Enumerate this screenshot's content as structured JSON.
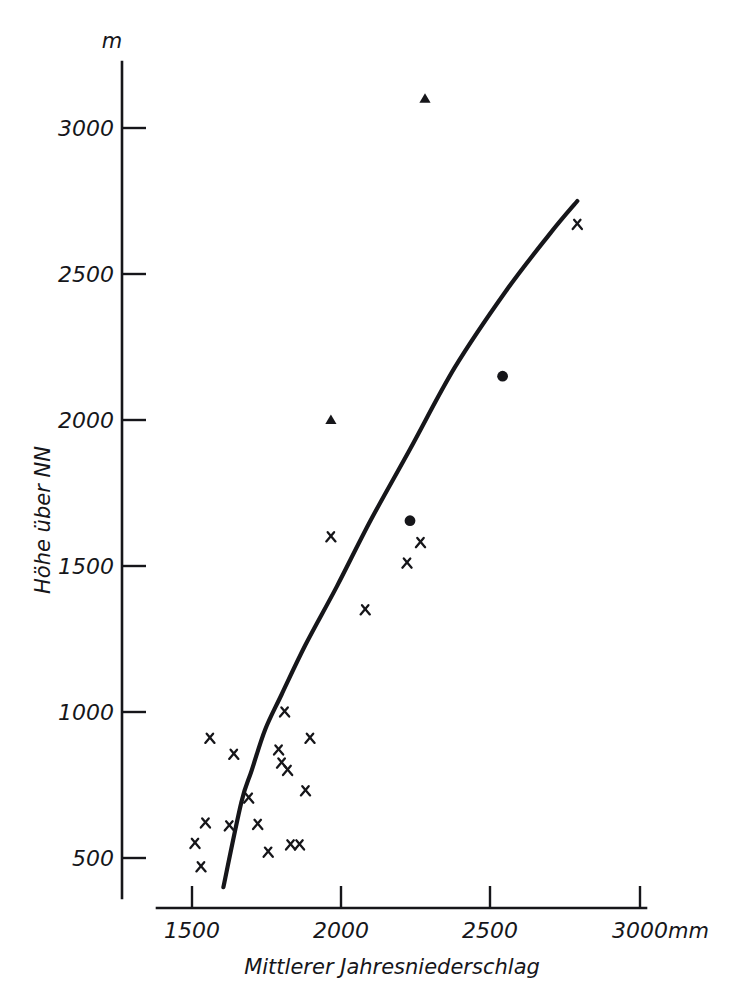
{
  "figure": {
    "cut_off_caption": "",
    "background_color": "#ffffff",
    "ink_color": "#16161a"
  },
  "axes": {
    "y": {
      "unit_label": "m",
      "title": "Höhe über NN",
      "ticks": [
        "500",
        "1000",
        "1500",
        "2000",
        "2500",
        "3000"
      ],
      "range": [
        380,
        3180
      ]
    },
    "x": {
      "unit_label": "mm",
      "title": "Mittlerer Jahresniederschlag",
      "ticks": [
        "1500",
        "2000",
        "2500",
        "3000"
      ],
      "range": [
        1380,
        3080
      ]
    }
  },
  "chart_data": {
    "type": "scatter",
    "title": "",
    "xlabel": "Mittlerer Jahresniederschlag",
    "ylabel": "Höhe über NN",
    "x_unit": "mm",
    "y_unit": "m",
    "xlim": [
      1380,
      3080
    ],
    "ylim": [
      380,
      3180
    ],
    "xticks": [
      1500,
      2000,
      2500,
      3000
    ],
    "yticks": [
      500,
      1000,
      1500,
      2000,
      2500,
      3000
    ],
    "grid": false,
    "legend": "none",
    "series": [
      {
        "name": "cross-markers",
        "marker": "x",
        "points": [
          [
            1560,
            910
          ],
          [
            1510,
            550
          ],
          [
            1545,
            620
          ],
          [
            1530,
            470
          ],
          [
            1625,
            610
          ],
          [
            1690,
            705
          ],
          [
            1720,
            615
          ],
          [
            1755,
            520
          ],
          [
            1790,
            870
          ],
          [
            1800,
            825
          ],
          [
            1820,
            800
          ],
          [
            1830,
            545
          ],
          [
            1860,
            545
          ],
          [
            1810,
            1000
          ],
          [
            1895,
            910
          ],
          [
            1880,
            730
          ],
          [
            1965,
            1600
          ],
          [
            2080,
            1350
          ],
          [
            2220,
            1510
          ],
          [
            2265,
            1580
          ],
          [
            2790,
            2670
          ],
          [
            1640,
            855
          ]
        ]
      },
      {
        "name": "filled-circle-markers",
        "marker": "o",
        "points": [
          [
            2230,
            1655
          ],
          [
            2540,
            2150
          ]
        ]
      },
      {
        "name": "triangle-markers",
        "marker": "^",
        "points": [
          [
            1965,
            2000
          ],
          [
            2280,
            3100
          ]
        ]
      }
    ],
    "fit_curve": {
      "name": "regression-curve",
      "points": [
        [
          1605,
          400
        ],
        [
          1665,
          690
        ],
        [
          1700,
          800
        ],
        [
          1745,
          940
        ],
        [
          1800,
          1060
        ],
        [
          1880,
          1230
        ],
        [
          1985,
          1430
        ],
        [
          2100,
          1660
        ],
        [
          2230,
          1900
        ],
        [
          2380,
          2180
        ],
        [
          2550,
          2440
        ],
        [
          2700,
          2640
        ],
        [
          2790,
          2750
        ]
      ]
    }
  }
}
